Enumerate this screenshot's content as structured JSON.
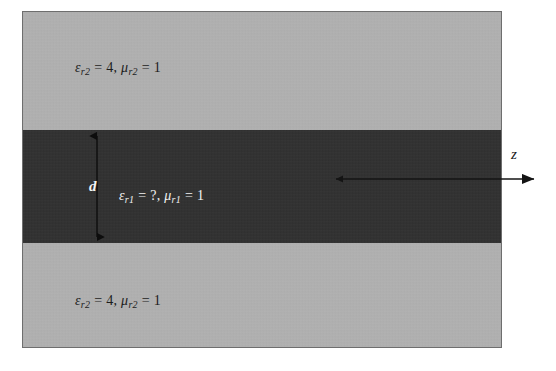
{
  "figure": {
    "colors": {
      "cladding_fill": "#b4b4b4",
      "core_fill": "#2e2e2e",
      "border": "#6e6e6e",
      "dark_text": "#1c1c1c",
      "light_text": "#f2f2f2",
      "arrow": "#141414"
    },
    "regions": {
      "upper_cladding": {
        "epsilon_symbol": "ε",
        "epsilon_subscript": "r2",
        "epsilon_value": "4",
        "mu_symbol": "μ",
        "mu_subscript": "r2",
        "mu_value": "1",
        "equals": "=",
        "separator": ", ",
        "full_text": "εr2 = 4, μr2 = 1"
      },
      "core": {
        "epsilon_symbol": "ε",
        "epsilon_subscript": "r1",
        "epsilon_value": "?",
        "mu_symbol": "μ",
        "mu_subscript": "r1",
        "mu_value": "1",
        "equals": "=",
        "separator": ", ",
        "full_text": "εr1 = ?, μr1 = 1"
      },
      "lower_cladding": {
        "epsilon_symbol": "ε",
        "epsilon_subscript": "r2",
        "epsilon_value": "4",
        "mu_symbol": "μ",
        "mu_subscript": "r2",
        "mu_value": "1",
        "equals": "=",
        "separator": ", ",
        "full_text": "εr2 = 4, μr2 = 1"
      }
    },
    "annotations": {
      "thickness_label": "d",
      "axis_label": "z"
    }
  }
}
